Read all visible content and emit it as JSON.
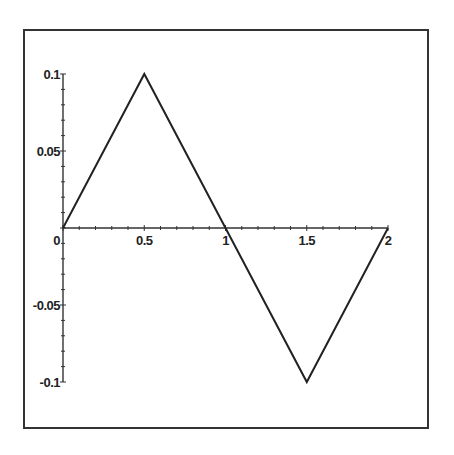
{
  "chart_data": {
    "type": "line",
    "title": "",
    "xlabel": "",
    "ylabel": "",
    "x": [
      0,
      0.5,
      1,
      1.5,
      2
    ],
    "series": [
      {
        "name": "triangle wave",
        "values": [
          0,
          0.1,
          0,
          -0.1,
          0
        ],
        "color": "#222222"
      }
    ],
    "xlim": [
      0,
      2
    ],
    "ylim": [
      -0.1,
      0.1
    ],
    "x_ticks": [
      0,
      0.5,
      1,
      1.5,
      2
    ],
    "x_tick_labels": [
      "0",
      "0.5",
      "1",
      "1.5",
      "2"
    ],
    "y_ticks": [
      0.1,
      0.05,
      0,
      -0.05,
      -0.1
    ],
    "y_tick_labels": [
      "0.1",
      "0.05",
      "0",
      "-0.05",
      "-0.1"
    ],
    "grid": false,
    "legend": null,
    "frame": true
  }
}
